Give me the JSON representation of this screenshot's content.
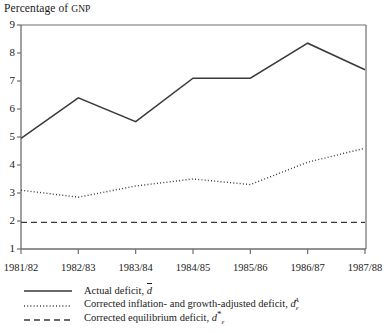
{
  "axis_title": {
    "prefix": "Percentage of ",
    "smallcaps": "GNP"
  },
  "colors": {
    "line": "#3a3a3a",
    "axis": "#6e6e6e",
    "text": "#1a1a1a"
  },
  "legend": [
    {
      "style": "solid",
      "label_prefix": "Actual deficit, ",
      "symbol_base": "d",
      "symbol_overbar": true,
      "symbol_sub": "",
      "symbol_sup": ""
    },
    {
      "style": "dotted",
      "label_prefix": "Corrected inflation- and growth-adjusted deficit, ",
      "symbol_base": "d",
      "symbol_overbar": false,
      "symbol_sub": "ε",
      "symbol_sup": "A"
    },
    {
      "style": "dashed",
      "label_prefix": "Corrected equilibrium deficit, ",
      "symbol_base": "d",
      "symbol_overbar": false,
      "symbol_sub": "ε",
      "symbol_sup": "*"
    }
  ],
  "chart_data": {
    "type": "line",
    "title": "Percentage of GNP",
    "xlabel": "",
    "ylabel": "Percentage of GNP",
    "grid": false,
    "legend_position": "below",
    "categories": [
      "1981/82",
      "1982/83",
      "1983/84",
      "1984/85",
      "1985/86",
      "1986/87",
      "1987/88"
    ],
    "ylim": [
      1,
      9
    ],
    "yticks": [
      1,
      2,
      3,
      4,
      5,
      6,
      7,
      8,
      9
    ],
    "series": [
      {
        "name": "Actual deficit, d̄",
        "style": "solid",
        "values": [
          4.95,
          6.4,
          5.55,
          7.1,
          7.1,
          8.35,
          7.4
        ]
      },
      {
        "name": "Corrected inflation- and growth-adjusted deficit, dεA",
        "style": "dotted",
        "values": [
          3.1,
          2.85,
          3.25,
          3.5,
          3.3,
          4.1,
          4.6
        ]
      },
      {
        "name": "Corrected equilibrium deficit, dε*",
        "style": "dashed",
        "values": [
          1.95,
          1.95,
          1.95,
          1.95,
          1.95,
          1.95,
          1.95
        ]
      }
    ]
  }
}
